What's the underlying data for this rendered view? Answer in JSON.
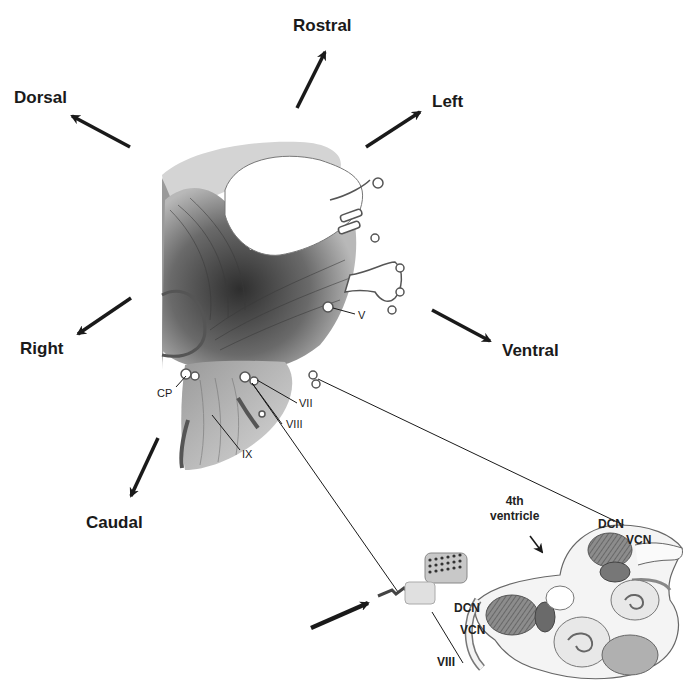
{
  "directions": {
    "rostral": "Rostral",
    "dorsal": "Dorsal",
    "left": "Left",
    "right": "Right",
    "ventral": "Ventral",
    "caudal": "Caudal"
  },
  "nerves": {
    "trigeminal": "V",
    "cp": "CP",
    "facial": "VII",
    "vestibulocochlear": "VIII",
    "glossopharyngeal": "IX"
  },
  "inset": {
    "ventricle_line1": "4th",
    "ventricle_line2": "ventricle",
    "dcn_upper": "DCN",
    "vcn_upper": "VCN",
    "dcn_lower": "DCN",
    "vcn_lower": "VCN",
    "nerve_viii": "VIII"
  },
  "colors": {
    "ink": "#1a1a1a",
    "shade_dark": "#4a4a4a",
    "shade_mid": "#8a8a8a",
    "shade_light": "#c8c8c8",
    "background": "#ffffff"
  }
}
